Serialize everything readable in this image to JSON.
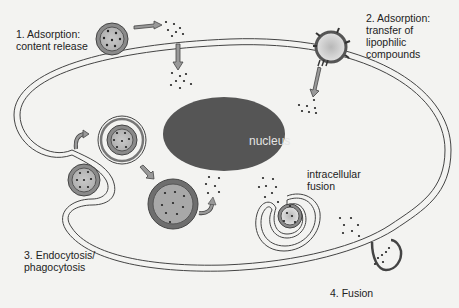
{
  "labels": {
    "adsorption_content": "1. Adsorption:\ncontent release",
    "adsorption_transfer": "2. Adsorption:\ntransfer of\nlipophilic\ncompounds",
    "endocytosis": "3. Endocytosis/\nphagocytosis",
    "fusion": "4. Fusion",
    "intracellular_fusion": "intracellular\nfusion",
    "nucleus": "nucleus"
  },
  "colors": {
    "background": "#f3f3f1",
    "membrane": "#444444",
    "nucleus": "#555555",
    "vesicle_outer": "#7a7a7a",
    "vesicle_fill": "#b8b8b8",
    "arrow_fill": "#999999",
    "dots": "#222222"
  }
}
